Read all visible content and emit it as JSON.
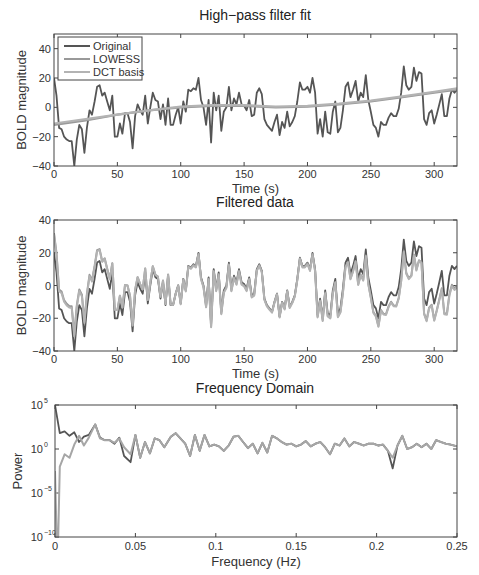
{
  "chart_data": [
    {
      "type": "line",
      "title": "High−pass filter fit",
      "xlabel": "Time (s)",
      "ylabel": "BOLD magnitude",
      "xlim": [
        0,
        318
      ],
      "ylim": [
        -40,
        50
      ],
      "xticks": [
        0,
        50,
        100,
        150,
        200,
        250,
        300
      ],
      "yticks": [
        -40,
        -20,
        0,
        20,
        40
      ],
      "grid": false,
      "legend_position": "upper left",
      "box": {
        "left": 54,
        "top": 34,
        "right": 457,
        "bottom": 166
      },
      "series": [
        {
          "name": "Original",
          "color": "#555555",
          "width": 1.8,
          "x": [
            0,
            2,
            4,
            6,
            8,
            10,
            12,
            14,
            16,
            18,
            20,
            22,
            24,
            26,
            28,
            30,
            32,
            34,
            36,
            38,
            40,
            42,
            44,
            46,
            48,
            50,
            52,
            54,
            56,
            58,
            60,
            62,
            64,
            66,
            68,
            70,
            72,
            74,
            76,
            78,
            80,
            82,
            84,
            86,
            88,
            90,
            92,
            94,
            96,
            98,
            100,
            102,
            104,
            106,
            108,
            110,
            112,
            114,
            116,
            118,
            120,
            122,
            124,
            126,
            128,
            130,
            132,
            134,
            136,
            138,
            140,
            142,
            144,
            146,
            148,
            150,
            152,
            154,
            156,
            158,
            160,
            162,
            164,
            166,
            168,
            170,
            172,
            174,
            176,
            178,
            180,
            182,
            184,
            186,
            188,
            190,
            192,
            194,
            196,
            198,
            200,
            202,
            204,
            206,
            208,
            210,
            212,
            214,
            216,
            218,
            220,
            222,
            224,
            226,
            228,
            230,
            232,
            234,
            236,
            238,
            240,
            242,
            244,
            246,
            248,
            250,
            252,
            254,
            256,
            258,
            260,
            262,
            264,
            266,
            268,
            270,
            272,
            274,
            276,
            278,
            280,
            282,
            284,
            286,
            288,
            290,
            292,
            294,
            296,
            298,
            300,
            302,
            304,
            306,
            308,
            310,
            312,
            314,
            316,
            318
          ],
          "y": [
            20,
            8,
            -14,
            -15,
            -20,
            -22,
            -23,
            -23,
            -40,
            -22,
            -12,
            -15,
            -31,
            -14,
            -2,
            -5,
            4,
            14,
            15,
            8,
            10,
            4,
            -2,
            8,
            -20,
            -20,
            -11,
            -18,
            -4,
            -4,
            -10,
            -28,
            -6,
            2,
            -2,
            -5,
            8,
            -11,
            0,
            10,
            5,
            4,
            -8,
            2,
            -12,
            6,
            -12,
            -12,
            -5,
            0,
            -11,
            4,
            -3,
            12,
            11,
            13,
            12,
            20,
            5,
            0,
            -12,
            5,
            -24,
            10,
            -2,
            8,
            -16,
            -3,
            0,
            14,
            -2,
            6,
            2,
            10,
            2,
            1,
            -2,
            5,
            -6,
            -5,
            10,
            13,
            9,
            -8,
            -12,
            -14,
            -16,
            -10,
            -5,
            -19,
            -10,
            -14,
            -3,
            -13,
            -10,
            -6,
            4,
            17,
            12,
            12,
            14,
            10,
            20,
            10,
            -18,
            -8,
            -20,
            -3,
            -17,
            -18,
            -3,
            4,
            -17,
            -14,
            -2,
            14,
            17,
            7,
            12,
            18,
            4,
            10,
            7,
            22,
            5,
            -3,
            -12,
            -14,
            -20,
            -10,
            -12,
            -12,
            -7,
            -4,
            -6,
            -6,
            -1,
            10,
            28,
            15,
            12,
            14,
            27,
            18,
            24,
            23,
            -8,
            -12,
            -4,
            -2,
            -11,
            -5,
            2,
            9,
            -6,
            -6,
            6,
            12,
            10,
            12,
            28,
            5,
            14,
            20
          ],
          "y_note": "approximate trace read from pixels"
        },
        {
          "name": "LOWESS",
          "color": "#999999",
          "width": 2.2,
          "x": [
            0,
            25,
            50,
            75,
            100,
            125,
            150,
            175,
            200,
            225,
            250,
            275,
            300,
            318
          ],
          "y": [
            -12,
            -9,
            -5,
            -2,
            0,
            1,
            1,
            0,
            0.5,
            2,
            4,
            7,
            10,
            12
          ]
        },
        {
          "name": "DCT basis",
          "color": "#b3b3b3",
          "width": 2.2,
          "x": [
            0,
            25,
            50,
            75,
            100,
            125,
            150,
            175,
            200,
            225,
            250,
            275,
            300,
            318
          ],
          "y": [
            -11,
            -8,
            -5,
            -2,
            0.5,
            1.5,
            1.5,
            0.5,
            1,
            2.5,
            4.5,
            7.5,
            10.5,
            13
          ]
        }
      ]
    },
    {
      "type": "line",
      "title": "Filtered data",
      "xlabel": "Time (s)",
      "ylabel": "BOLD magnitude",
      "xlim": [
        0,
        318
      ],
      "ylim": [
        -40,
        40
      ],
      "xticks": [
        0,
        50,
        100,
        150,
        200,
        250,
        300
      ],
      "yticks": [
        -40,
        -20,
        0,
        20,
        40
      ],
      "grid": false,
      "box": {
        "left": 54,
        "top": 220,
        "right": 457,
        "bottom": 351
      },
      "series": [
        {
          "name": "Original",
          "color": "#555555",
          "width": 1.8,
          "source": "same as plot 1 Original"
        },
        {
          "name": "LOWESS-filtered",
          "color": "#999999",
          "width": 2.0,
          "source": "Original minus LOWESS"
        },
        {
          "name": "DCT-filtered",
          "color": "#b3b3b3",
          "width": 2.0,
          "source": "Original minus DCT basis"
        }
      ]
    },
    {
      "type": "line",
      "title": "Frequency Domain",
      "xlabel": "Frequency (Hz)",
      "ylabel": "Power",
      "xlim": [
        0,
        0.25
      ],
      "ylim_log10": [
        -10,
        5
      ],
      "yscale": "log",
      "xticks": [
        0,
        0.05,
        0.1,
        0.15,
        0.2,
        0.25
      ],
      "xtick_labels": [
        "0",
        "0.05",
        "0.1",
        "0.15",
        "0.2",
        "0.25"
      ],
      "yticks_log10": [
        -10,
        -5,
        0,
        5
      ],
      "grid": false,
      "box": {
        "left": 55,
        "top": 405,
        "right": 457,
        "bottom": 537
      },
      "series": [
        {
          "name": "Original",
          "color": "#555555",
          "width": 1.8,
          "f": [
            0,
            0.003,
            0.006,
            0.009,
            0.012,
            0.015,
            0.018,
            0.021,
            0.025,
            0.028,
            0.031,
            0.034,
            0.037,
            0.04,
            0.043,
            0.047,
            0.05,
            0.053,
            0.056,
            0.059,
            0.062,
            0.065,
            0.068,
            0.072,
            0.075,
            0.078,
            0.081,
            0.084,
            0.087,
            0.09,
            0.093,
            0.096,
            0.099,
            0.102,
            0.105,
            0.108,
            0.111,
            0.114,
            0.117,
            0.12,
            0.123,
            0.126,
            0.129,
            0.132,
            0.135,
            0.138,
            0.141,
            0.144,
            0.147,
            0.15,
            0.153,
            0.156,
            0.159,
            0.162,
            0.165,
            0.168,
            0.171,
            0.174,
            0.177,
            0.18,
            0.183,
            0.186,
            0.189,
            0.192,
            0.195,
            0.198,
            0.201,
            0.204,
            0.207,
            0.21,
            0.213,
            0.216,
            0.219,
            0.222,
            0.225,
            0.228,
            0.231,
            0.234,
            0.237,
            0.24,
            0.243,
            0.246,
            0.25
          ],
          "log10_power": [
            5,
            1.8,
            2.0,
            1.5,
            1.9,
            0.8,
            1.4,
            1.6,
            2.8,
            1.3,
            1.0,
            1.0,
            0.6,
            1.3,
            -0.8,
            -1.5,
            1.6,
            -1.0,
            0.8,
            -0.5,
            1.2,
            1.0,
            0.2,
            1.4,
            1.8,
            1.2,
            0.6,
            -0.8,
            1.6,
            -0.2,
            1.6,
            0.3,
            0.5,
            0.3,
            -0.2,
            0.4,
            1.4,
            1.5,
            0.8,
            0.1,
            0.6,
            -0.5,
            0.7,
            -0.4,
            1.5,
            1.2,
            0.8,
            0.5,
            0.6,
            0.3,
            0.5,
            0.9,
            0.3,
            0.6,
            0.8,
            0.2,
            -0.6,
            0.6,
            0.4,
            1.2,
            0.3,
            0.8,
            0.6,
            0.4,
            0.6,
            0.6,
            0.4,
            0.5,
            -0.2,
            -2.2,
            0.4,
            1.5,
            0.0,
            0.2,
            0.6,
            0.2,
            0.6,
            0.0,
            1.0,
            0.8,
            0.6,
            0.5,
            0.3
          ]
        },
        {
          "name": "Filtered",
          "color": "#a6a6a6",
          "width": 2.0,
          "f": [
            0,
            0.001,
            0.002,
            0.003,
            0.006,
            0.009,
            0.012,
            0.015,
            0.018,
            0.021,
            0.025,
            0.028,
            0.031,
            0.034,
            0.037,
            0.04,
            0.043,
            0.047,
            0.05,
            0.053,
            0.056,
            0.059,
            0.062,
            0.065,
            0.068,
            0.072,
            0.075,
            0.078,
            0.081,
            0.084,
            0.087,
            0.09,
            0.093,
            0.096,
            0.099,
            0.102,
            0.105,
            0.108,
            0.111,
            0.114,
            0.117,
            0.12,
            0.123,
            0.126,
            0.129,
            0.132,
            0.135,
            0.138,
            0.141,
            0.144,
            0.147,
            0.15,
            0.153,
            0.156,
            0.159,
            0.162,
            0.165,
            0.168,
            0.171,
            0.174,
            0.177,
            0.18,
            0.183,
            0.186,
            0.189,
            0.192,
            0.195,
            0.198,
            0.201,
            0.204,
            0.207,
            0.21,
            0.213,
            0.216,
            0.219,
            0.222,
            0.225,
            0.228,
            0.231,
            0.234,
            0.237,
            0.24,
            0.243,
            0.246,
            0.25
          ],
          "log10_power": [
            -2.5,
            -10,
            -10,
            -2.0,
            -0.6,
            -1.0,
            0.5,
            1.5,
            0.4,
            1.3,
            2.8,
            1.2,
            1.0,
            1.0,
            0.7,
            1.2,
            0.2,
            -0.6,
            1.6,
            -1.0,
            0.8,
            -0.5,
            1.2,
            1.0,
            0.2,
            1.4,
            1.8,
            1.2,
            0.6,
            -0.8,
            1.6,
            -0.2,
            1.6,
            0.3,
            0.5,
            0.3,
            -0.2,
            0.4,
            1.4,
            1.5,
            0.8,
            0.1,
            0.6,
            -0.5,
            0.7,
            -0.4,
            1.5,
            1.2,
            0.8,
            0.5,
            0.6,
            0.3,
            0.5,
            0.9,
            0.3,
            0.6,
            0.8,
            0.2,
            -0.6,
            0.6,
            0.4,
            1.2,
            0.3,
            0.8,
            0.6,
            0.4,
            0.6,
            0.6,
            0.4,
            0.5,
            -0.2,
            -1.0,
            0.4,
            1.5,
            0.0,
            0.2,
            0.6,
            0.2,
            0.6,
            0.0,
            1.0,
            0.8,
            0.6,
            0.5,
            0.3
          ]
        }
      ]
    }
  ],
  "legend": {
    "items": [
      {
        "label": "Original",
        "color": "#555555"
      },
      {
        "label": "LOWESS",
        "color": "#999999"
      },
      {
        "label": "DCT basis",
        "color": "#b3b3b3"
      }
    ]
  }
}
